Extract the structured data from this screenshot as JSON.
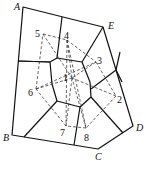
{
  "diagram": {
    "type": "voronoi-delaunay",
    "outer_vertices": [
      {
        "id": "A",
        "x": 23,
        "y": 7,
        "lx": 14,
        "ly": 10
      },
      {
        "id": "E",
        "x": 103,
        "y": 27,
        "lx": 108,
        "ly": 29
      },
      {
        "id": "D",
        "x": 133,
        "y": 126,
        "lx": 136,
        "ly": 131
      },
      {
        "id": "C",
        "x": 98,
        "y": 149,
        "lx": 95,
        "ly": 160
      },
      {
        "id": "B",
        "x": 12,
        "y": 135,
        "lx": 3,
        "ly": 141
      }
    ],
    "sites": [
      {
        "id": "1",
        "x": 72,
        "y": 78,
        "lx": 63,
        "ly": 81
      },
      {
        "id": "2",
        "x": 116,
        "y": 96,
        "lx": 117,
        "ly": 103
      },
      {
        "id": "3",
        "x": 96,
        "y": 62,
        "lx": 97,
        "ly": 64
      },
      {
        "id": "4",
        "x": 67,
        "y": 40,
        "lx": 64,
        "ly": 39
      },
      {
        "id": "5",
        "x": 43,
        "y": 34,
        "lx": 35,
        "ly": 37
      },
      {
        "id": "6",
        "x": 36,
        "y": 89,
        "lx": 28,
        "ly": 96
      },
      {
        "id": "7",
        "x": 66,
        "y": 126,
        "lx": 60,
        "ly": 136
      },
      {
        "id": "8",
        "x": 86,
        "y": 128,
        "lx": 84,
        "ly": 141
      }
    ],
    "labels": [
      "A",
      "B",
      "C",
      "D",
      "E",
      "1",
      "2",
      "3",
      "4",
      "5",
      "6",
      "7",
      "8"
    ]
  }
}
